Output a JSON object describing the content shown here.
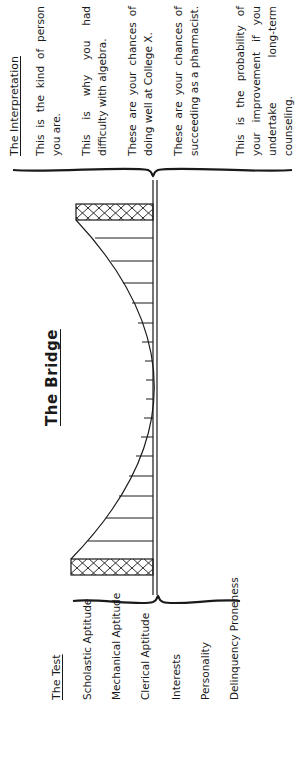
{
  "title": "The Bridge",
  "test": {
    "heading": "The Test",
    "items": [
      "Scholastic Aptitude",
      "Mechanical Aptitude",
      "Clerical Aptitude",
      "Interests",
      "Personality",
      "Delinquency Proneness"
    ]
  },
  "interpretation": {
    "heading": "The Interpretation",
    "items": [
      "This is the kind of person you are.",
      "This is why you had difficulty with algebra.",
      "These are your chances of doing well at College X.",
      "These are your chances of succeeding as a pharmacist.",
      "This is the probability of your improvement if you undertake long-term counseling."
    ]
  },
  "colors": {
    "ink": "#1a1a1a",
    "paper": "#ffffff"
  }
}
